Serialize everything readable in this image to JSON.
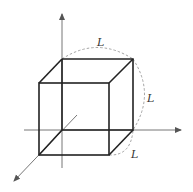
{
  "diagram": {
    "colors": {
      "edge": "#222222",
      "axis": "#666666",
      "dashed": "#999999",
      "label": "#333333"
    },
    "labels": {
      "top": "L",
      "right": "L",
      "bottom": "L"
    },
    "axes": [
      {
        "name": "vertical-axis",
        "from": [
          62,
          168
        ],
        "to": [
          62,
          12
        ]
      },
      {
        "name": "horizontal-axis",
        "from": [
          24,
          130
        ],
        "to": [
          183,
          130
        ]
      },
      {
        "name": "depth-axis",
        "from": [
          77,
          115
        ],
        "to": [
          13,
          182
        ]
      }
    ]
  }
}
